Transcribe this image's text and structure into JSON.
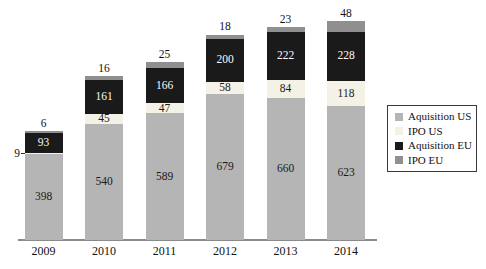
{
  "chart_data": {
    "type": "bar",
    "stacked": true,
    "title": "",
    "xlabel": "",
    "ylabel": "",
    "grid": false,
    "legend_position": "right",
    "categories": [
      "2009",
      "2010",
      "2011",
      "2012",
      "2013",
      "2014"
    ],
    "series": [
      {
        "name": "Aquisition US",
        "color": "#b5b5b5",
        "label_color": "#1a1a1a",
        "values": [
          398,
          540,
          589,
          679,
          660,
          623
        ]
      },
      {
        "name": "IPO US",
        "color": "#f4f2e6",
        "label_color": "#1a1a1a",
        "values": [
          9,
          45,
          47,
          58,
          84,
          118
        ]
      },
      {
        "name": "Aquisition EU",
        "color": "#1a1a1a",
        "label_color": "#fafafa",
        "values": [
          93,
          161,
          166,
          200,
          222,
          228
        ]
      },
      {
        "name": "IPO EU",
        "color": "#8f8f8f",
        "label_color": "#1a1a1a",
        "values": [
          6,
          16,
          25,
          18,
          23,
          48
        ]
      }
    ],
    "outside_label": {
      "category": "2009",
      "series": "IPO US",
      "value": "9"
    },
    "value_labels": "shown on every segment; IPO EU values above bars",
    "x_ticks": [
      "2009",
      "2010",
      "2011",
      "2012",
      "2013",
      "2014"
    ]
  },
  "legend": {
    "items": [
      "Aquisition US",
      "IPO US",
      "Aquisition EU",
      "IPO EU"
    ]
  }
}
